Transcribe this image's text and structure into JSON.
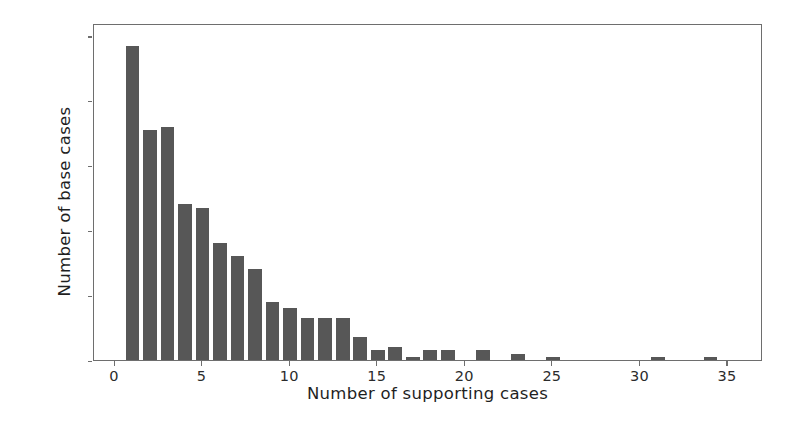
{
  "chart_data": {
    "type": "bar",
    "title": "",
    "xlabel": "Number of supporting cases",
    "ylabel": "Number of base cases",
    "xlim": [
      -1.2,
      37
    ],
    "ylim": [
      0,
      104
    ],
    "grid": false,
    "legend": null,
    "bar_color": "#575757",
    "axis_color": "#6e6e6e",
    "x_ticks": [
      0,
      5,
      10,
      15,
      20,
      25,
      30,
      35
    ],
    "x_tick_labels": [
      "0",
      "5",
      "10",
      "15",
      "20",
      "25",
      "30",
      "35"
    ],
    "y_ticks": [
      0,
      20,
      40,
      60,
      80,
      100
    ],
    "y_tick_labels": [
      "0",
      "20",
      "40",
      "60",
      "80",
      "100"
    ],
    "categories": [
      1,
      2,
      3,
      4,
      5,
      6,
      7,
      8,
      9,
      10,
      11,
      12,
      13,
      14,
      15,
      16,
      17,
      18,
      19,
      21,
      23,
      25,
      31,
      34
    ],
    "values": [
      97,
      71,
      72,
      48,
      47,
      36,
      32,
      28,
      18,
      16,
      13,
      13,
      13,
      7,
      3,
      4,
      1,
      3,
      3,
      3,
      2,
      1,
      1,
      1
    ]
  }
}
